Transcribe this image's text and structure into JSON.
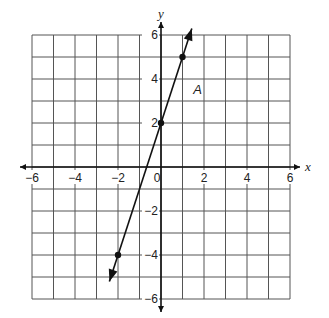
{
  "chart_data": {
    "type": "line",
    "title": "",
    "xlabel": "x",
    "ylabel": "y",
    "xlim": [
      -6,
      6
    ],
    "ylim": [
      -6,
      6
    ],
    "grid": true,
    "grid_step": 1,
    "x_ticks": [
      -6,
      -4,
      -2,
      0,
      2,
      4,
      6
    ],
    "y_ticks": [
      -6,
      -4,
      -2,
      2,
      4,
      6
    ],
    "x_tick_labels": [
      "−6",
      "−4",
      "−2",
      "0",
      "2",
      "4",
      "6"
    ],
    "y_tick_labels": [
      "−6",
      "−4",
      "−2",
      "2",
      "4",
      "6"
    ],
    "series": [
      {
        "name": "A",
        "equation": "y = 3x + 2",
        "points": [
          {
            "x": -2,
            "y": -4
          },
          {
            "x": 0,
            "y": 2
          },
          {
            "x": 1,
            "y": 5
          }
        ],
        "arrows_both_ends": true,
        "color": "#111111"
      }
    ],
    "annotations": [
      {
        "text": "A",
        "x": 1.5,
        "y": 3.3
      }
    ]
  },
  "labels": {
    "x_axis": "x",
    "y_axis": "y",
    "line_label": "A"
  }
}
